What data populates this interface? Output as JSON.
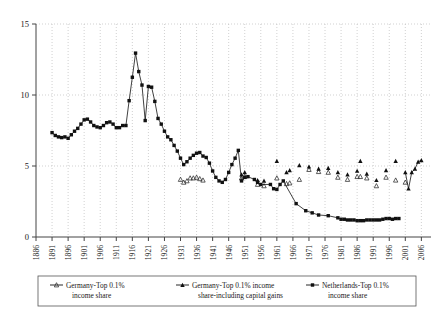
{
  "chart_data": {
    "type": "line",
    "title": "",
    "xlabel": "",
    "ylabel": "",
    "xlim": [
      1886,
      2009
    ],
    "ylim": [
      0,
      15
    ],
    "yticks": [
      0,
      5,
      10,
      15
    ],
    "xticks": [
      1886,
      1891,
      1896,
      1901,
      1906,
      1911,
      1916,
      1921,
      1926,
      1931,
      1936,
      1941,
      1946,
      1951,
      1956,
      1961,
      1966,
      1971,
      1976,
      1981,
      1986,
      1991,
      1996,
      2001,
      2006
    ],
    "grid": true,
    "legend_position": "bottom",
    "series": [
      {
        "name": "Germany-Top 0.1% income share",
        "marker": "open-triangle",
        "connected": false,
        "points": [
          [
            1931,
            4.05
          ],
          [
            1932,
            3.85
          ],
          [
            1933,
            3.95
          ],
          [
            1934,
            4.15
          ],
          [
            1935,
            4.15
          ],
          [
            1936,
            4.2
          ],
          [
            1937,
            4.1
          ],
          [
            1938,
            4.0
          ],
          [
            1950,
            4.15
          ],
          [
            1951,
            4.25
          ],
          [
            1955,
            3.7
          ],
          [
            1957,
            3.6
          ],
          [
            1961,
            4.15
          ],
          [
            1964,
            3.75
          ],
          [
            1965,
            3.8
          ],
          [
            1968,
            4.05
          ],
          [
            1971,
            4.75
          ],
          [
            1974,
            4.6
          ],
          [
            1977,
            4.55
          ],
          [
            1980,
            4.2
          ],
          [
            1983,
            4.05
          ],
          [
            1986,
            4.25
          ],
          [
            1987,
            4.25
          ],
          [
            1989,
            4.15
          ],
          [
            1992,
            3.6
          ],
          [
            1995,
            4.2
          ],
          [
            1998,
            4.0
          ],
          [
            2001,
            3.85
          ]
        ]
      },
      {
        "name": "Germany-Top 0.1% income share-including capital gains",
        "marker": "filled-triangle",
        "connected": false,
        "points": [
          [
            1950,
            4.4
          ],
          [
            1951,
            4.55
          ],
          [
            1955,
            4.0
          ],
          [
            1957,
            3.95
          ],
          [
            1961,
            5.35
          ],
          [
            1964,
            4.55
          ],
          [
            1965,
            4.7
          ],
          [
            1968,
            5.05
          ],
          [
            1971,
            4.95
          ],
          [
            1974,
            4.8
          ],
          [
            1977,
            4.85
          ],
          [
            1980,
            4.55
          ],
          [
            1983,
            4.4
          ],
          [
            1986,
            4.65
          ],
          [
            1987,
            5.35
          ],
          [
            1989,
            4.45
          ],
          [
            1992,
            4.0
          ],
          [
            1995,
            4.7
          ],
          [
            1998,
            5.35
          ],
          [
            2001,
            4.55
          ],
          [
            2002,
            3.4
          ],
          [
            2003,
            4.55
          ],
          [
            2004,
            4.8
          ],
          [
            2005,
            5.3
          ],
          [
            2006,
            5.4
          ]
        ]
      },
      {
        "name": "Netherlands-Top 0.1% income share",
        "marker": "filled-square",
        "connected": true,
        "points": [
          [
            1891,
            7.35
          ],
          [
            1892,
            7.15
          ],
          [
            1893,
            7.05
          ],
          [
            1894,
            7.0
          ],
          [
            1895,
            7.05
          ],
          [
            1896,
            6.95
          ],
          [
            1897,
            7.2
          ],
          [
            1898,
            7.45
          ],
          [
            1899,
            7.65
          ],
          [
            1900,
            7.95
          ],
          [
            1901,
            8.25
          ],
          [
            1902,
            8.3
          ],
          [
            1903,
            8.1
          ],
          [
            1904,
            7.85
          ],
          [
            1905,
            7.75
          ],
          [
            1906,
            7.7
          ],
          [
            1907,
            7.85
          ],
          [
            1908,
            8.05
          ],
          [
            1909,
            8.1
          ],
          [
            1910,
            7.95
          ],
          [
            1911,
            7.7
          ],
          [
            1912,
            7.7
          ],
          [
            1913,
            7.85
          ],
          [
            1914,
            7.85
          ],
          [
            1915,
            9.6
          ],
          [
            1916,
            11.25
          ],
          [
            1917,
            12.95
          ],
          [
            1918,
            11.65
          ],
          [
            1919,
            10.7
          ],
          [
            1920,
            8.2
          ],
          [
            1921,
            10.6
          ],
          [
            1922,
            10.55
          ],
          [
            1923,
            9.55
          ],
          [
            1924,
            8.35
          ],
          [
            1925,
            7.95
          ],
          [
            1926,
            7.45
          ],
          [
            1927,
            7.05
          ],
          [
            1928,
            6.85
          ],
          [
            1929,
            6.45
          ],
          [
            1930,
            6.05
          ],
          [
            1931,
            5.55
          ],
          [
            1932,
            5.1
          ],
          [
            1933,
            5.3
          ],
          [
            1934,
            5.55
          ],
          [
            1935,
            5.75
          ],
          [
            1936,
            5.9
          ],
          [
            1937,
            5.95
          ],
          [
            1938,
            5.7
          ],
          [
            1939,
            5.6
          ],
          [
            1940,
            5.2
          ],
          [
            1941,
            4.65
          ],
          [
            1942,
            4.2
          ],
          [
            1943,
            3.95
          ],
          [
            1944,
            3.85
          ],
          [
            1945,
            4.05
          ],
          [
            1946,
            4.55
          ],
          [
            1947,
            5.1
          ],
          [
            1948,
            5.55
          ],
          [
            1949,
            6.1
          ],
          [
            1950,
            3.95
          ],
          [
            1951,
            4.2
          ],
          [
            1952,
            4.25
          ],
          [
            1954,
            4.05
          ],
          [
            1955,
            3.85
          ],
          [
            1956,
            3.7
          ],
          [
            1959,
            3.7
          ],
          [
            1960,
            3.4
          ],
          [
            1961,
            3.35
          ],
          [
            1962,
            3.7
          ],
          [
            1963,
            3.95
          ],
          [
            1967,
            2.35
          ],
          [
            1970,
            1.85
          ],
          [
            1972,
            1.7
          ],
          [
            1974,
            1.55
          ],
          [
            1977,
            1.5
          ],
          [
            1980,
            1.35
          ],
          [
            1981,
            1.25
          ],
          [
            1982,
            1.25
          ],
          [
            1983,
            1.2
          ],
          [
            1984,
            1.2
          ],
          [
            1985,
            1.2
          ],
          [
            1986,
            1.15
          ],
          [
            1987,
            1.15
          ],
          [
            1988,
            1.15
          ],
          [
            1989,
            1.2
          ],
          [
            1990,
            1.2
          ],
          [
            1991,
            1.2
          ],
          [
            1992,
            1.2
          ],
          [
            1993,
            1.2
          ],
          [
            1994,
            1.25
          ],
          [
            1995,
            1.3
          ],
          [
            1996,
            1.3
          ],
          [
            1997,
            1.25
          ],
          [
            1998,
            1.3
          ],
          [
            1999,
            1.3
          ]
        ]
      }
    ],
    "legend": [
      {
        "label_line1": "Germany-Top 0.1%",
        "label_line2": "income share",
        "marker": "open-triangle"
      },
      {
        "label_line1": "Germany-Top 0.1% income",
        "label_line2": "share-including capital gains",
        "marker": "filled-triangle"
      },
      {
        "label_line1": "Netherlands-Top 0.1%",
        "label_line2": "income share",
        "marker": "filled-square"
      }
    ]
  }
}
